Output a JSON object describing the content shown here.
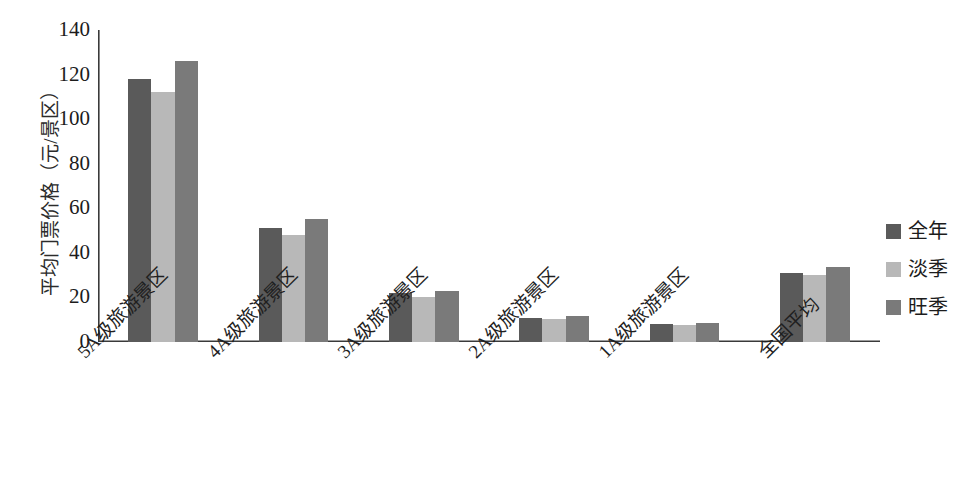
{
  "chart_data": {
    "type": "bar",
    "title": "",
    "xlabel": "",
    "ylabel": "平均门票价格（元/景区）",
    "ylim": [
      0,
      140
    ],
    "ytick_step": 20,
    "yticks": [
      140,
      120,
      100,
      80,
      60,
      40,
      20,
      0
    ],
    "grid": false,
    "legend_position": "right",
    "categories": [
      "5A级旅游景区",
      "4A级旅游景区",
      "3A级旅游景区",
      "2A级旅游景区",
      "1A级旅游景区",
      "全国平均"
    ],
    "series": [
      {
        "name": "全年",
        "color": "#5a5a5a",
        "values": [
          118,
          51,
          22,
          11,
          8,
          31
        ]
      },
      {
        "name": "淡季",
        "color": "#b8b8b8",
        "values": [
          112,
          48,
          20,
          10.5,
          7.5,
          30
        ]
      },
      {
        "name": "旺季",
        "color": "#7a7a7a",
        "values": [
          126,
          55,
          23,
          11.5,
          8.5,
          33.5
        ]
      }
    ]
  },
  "axis": {
    "line_color": "#3a3a3a"
  }
}
